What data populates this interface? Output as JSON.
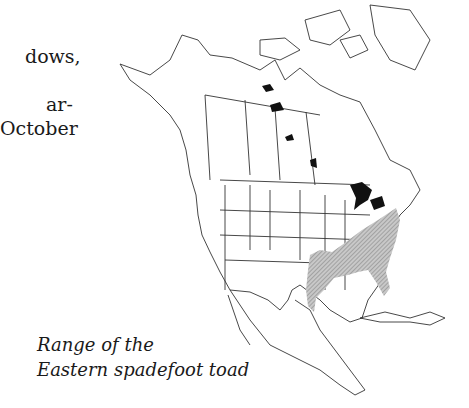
{
  "page": {
    "body_text_lines": [
      "dows,",
      "",
      "ar-",
      "October"
    ],
    "caption_lines": [
      "Range of the",
      "Eastern spadefoot toad"
    ]
  },
  "map": {
    "title": "Range of the Eastern spadefoot toad",
    "region": "North America",
    "legend": {
      "range_fill": "hatched gray",
      "lakes_fill": "black"
    },
    "colors": {
      "outline": "#333333",
      "range": "#9a9a9a",
      "lakes": "#111111",
      "background": "#ffffff"
    }
  }
}
